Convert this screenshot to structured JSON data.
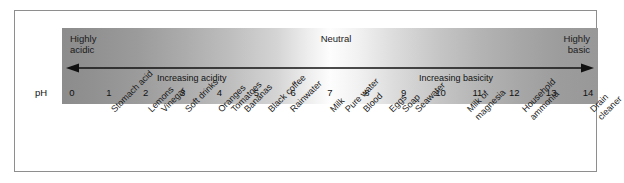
{
  "figure": {
    "axis_label": "pH",
    "bar": {
      "left_corner_label": "Highly\nacidic",
      "center_label": "Neutral",
      "right_corner_label": "Highly\nbasic",
      "arrow_left_caption": "Increasing acidity",
      "arrow_right_caption": "Increasing basicity",
      "arrow_type": "double-headed-horizontal",
      "gradient_start_color": "#8c8c8c",
      "gradient_mid_color": "#fdfdfd",
      "gradient_end_color": "#989898"
    },
    "ticks": [
      {
        "value": "0"
      },
      {
        "value": "1"
      },
      {
        "value": "2"
      },
      {
        "value": "3"
      },
      {
        "value": "4"
      },
      {
        "value": "5"
      },
      {
        "value": "6"
      },
      {
        "value": "7"
      },
      {
        "value": "8"
      },
      {
        "value": "9"
      },
      {
        "value": "10"
      },
      {
        "value": "11"
      },
      {
        "value": "12"
      },
      {
        "value": "13"
      },
      {
        "value": "14"
      }
    ],
    "substances": [
      {
        "text": "Stomach acid",
        "ph": 1
      },
      {
        "text": "Lemons",
        "ph": 2
      },
      {
        "text": "Vinegar",
        "ph": 2.35
      },
      {
        "text": "Soft drinks",
        "ph": 3
      },
      {
        "text": "Oranges",
        "ph": 3.9
      },
      {
        "text": "Tomatoes",
        "ph": 4.25
      },
      {
        "text": "Bananas",
        "ph": 4.6
      },
      {
        "text": "Black coffee",
        "ph": 5.25
      },
      {
        "text": "Rainwater",
        "ph": 5.85
      },
      {
        "text": "Milk",
        "ph": 6.95
      },
      {
        "text": "Pure water",
        "ph": 7.35
      },
      {
        "text": "Blood",
        "ph": 7.85
      },
      {
        "text": "Eggs",
        "ph": 8.55
      },
      {
        "text": "Soap",
        "ph": 8.9
      },
      {
        "text": "Seawater",
        "ph": 9.25
      },
      {
        "text": "Milk of\nmagnesia",
        "ph": 10.65
      },
      {
        "text": "Household\nammonia",
        "ph": 12.15
      },
      {
        "text": "Drain cleaner",
        "ph": 14
      }
    ]
  }
}
